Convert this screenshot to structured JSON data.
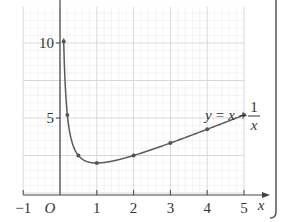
{
  "chart_data": {
    "type": "line",
    "title": "",
    "function_label": {
      "lhs": "y",
      "eq": "=",
      "x": "x",
      "plus": "+",
      "num": "1",
      "den": "x"
    },
    "xlabel": "x",
    "ylabel": "",
    "origin_label": "O",
    "xlim": [
      -1,
      5
    ],
    "ylim": [
      0,
      12.4
    ],
    "x_ticks": [
      {
        "value": -1,
        "label": "−1"
      },
      {
        "value": 1,
        "label": "1"
      },
      {
        "value": 2,
        "label": "2"
      },
      {
        "value": 3,
        "label": "3"
      },
      {
        "value": 4,
        "label": "4"
      },
      {
        "value": 5,
        "label": "5"
      }
    ],
    "y_ticks": [
      {
        "value": 5,
        "label": "5"
      },
      {
        "value": 10,
        "label": "10"
      }
    ],
    "grid": true,
    "series": [
      {
        "name": "y = x + 1/x",
        "points": [
          {
            "x": 0.1,
            "y": 10.1
          },
          {
            "x": 0.2,
            "y": 5.2
          },
          {
            "x": 0.5,
            "y": 2.5
          },
          {
            "x": 1,
            "y": 2
          },
          {
            "x": 2,
            "y": 2.5
          },
          {
            "x": 3,
            "y": 3.33
          },
          {
            "x": 4,
            "y": 4.25
          },
          {
            "x": 5,
            "y": 5.2
          }
        ],
        "color": "#555555"
      }
    ]
  },
  "colors": {
    "grid_major": "#d9d9d9",
    "grid_minor": "#ececec",
    "axis": "#444444",
    "curve": "#5a5a5a",
    "point": "#555555",
    "frame": "#555555"
  }
}
